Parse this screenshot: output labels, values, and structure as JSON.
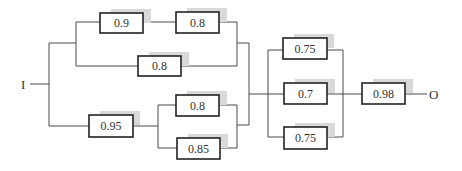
{
  "diagram": {
    "type": "reliability-block-diagram",
    "input_label": "I",
    "output_label": "O",
    "colors": {
      "wire": "#4a4a4a",
      "box_border": "#222222",
      "box_shadow": "#d9d9d9",
      "text": "#333333"
    },
    "blocks": [
      {
        "id": "b1",
        "label": "0.9",
        "x": 100,
        "y": 13,
        "w": 43,
        "h": 20
      },
      {
        "id": "b2",
        "label": "0.8",
        "x": 176,
        "y": 12,
        "w": 43,
        "h": 21
      },
      {
        "id": "b3",
        "label": "0.8",
        "x": 138,
        "y": 56,
        "w": 43,
        "h": 20
      },
      {
        "id": "b4",
        "label": "0.95",
        "x": 89,
        "y": 115,
        "w": 44,
        "h": 22
      },
      {
        "id": "b5",
        "label": "0.8",
        "x": 176,
        "y": 95,
        "w": 43,
        "h": 21
      },
      {
        "id": "b6",
        "label": "0.85",
        "x": 177,
        "y": 138,
        "w": 43,
        "h": 21
      },
      {
        "id": "b7",
        "label": "0.75",
        "x": 283,
        "y": 38,
        "w": 44,
        "h": 21
      },
      {
        "id": "b8",
        "label": "0.7",
        "x": 284,
        "y": 83,
        "w": 43,
        "h": 21
      },
      {
        "id": "b9",
        "label": "0.75",
        "x": 284,
        "y": 127,
        "w": 43,
        "h": 22
      },
      {
        "id": "b10",
        "label": "0.98",
        "x": 362,
        "y": 83,
        "w": 43,
        "h": 21
      }
    ],
    "structure": "I -> [ ((0.9 series 0.8) parallel 0.8) parallel (0.95 series (0.8 parallel 0.85)) ] -> [0.75 parallel 0.7 parallel 0.75] -> 0.98 -> O"
  }
}
